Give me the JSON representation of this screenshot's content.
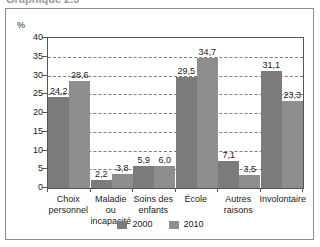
{
  "figure": {
    "cut_off_title": "Graphique 2.3",
    "frame_color": "#8c8c8c"
  },
  "chart_data": {
    "type": "bar",
    "title": "",
    "subtitle": "",
    "xlabel": "",
    "ylabel": "%",
    "ylim": [
      0,
      40
    ],
    "yticks": [
      "0",
      "5",
      "10",
      "15",
      "20",
      "25",
      "30",
      "35",
      "40"
    ],
    "grid": true,
    "legend_position": "bottom",
    "categories": [
      "Choix personnel",
      "Maladie ou incapacité",
      "Soins des enfants",
      "École",
      "Autres raisons",
      "Involontaire"
    ],
    "category_lines": [
      [
        "Choix",
        "personnel"
      ],
      [
        "Maladie ou",
        "incapacité"
      ],
      [
        "Soins des",
        "enfants"
      ],
      [
        "École",
        ""
      ],
      [
        "Autres",
        "raisons"
      ],
      [
        "Involontaire",
        ""
      ]
    ],
    "series": [
      {
        "name": "2000",
        "color": "#7b7b7b",
        "values": [
          24.2,
          2.2,
          5.9,
          29.5,
          7.1,
          31.1
        ],
        "labels": [
          "24,2",
          "2,2",
          "5,9",
          "29,5",
          "7,1",
          "31,1"
        ]
      },
      {
        "name": "2010",
        "color": "#8e8e8e",
        "values": [
          28.6,
          3.8,
          6.0,
          34.7,
          3.5,
          23.3
        ],
        "labels": [
          "28,6",
          "3,8",
          "6,0",
          "34,7",
          "3,5",
          "23,3"
        ]
      }
    ]
  }
}
